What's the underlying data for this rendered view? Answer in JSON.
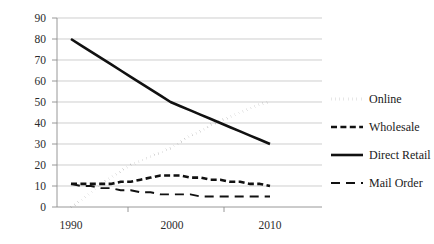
{
  "chart_data": {
    "type": "line",
    "title": "",
    "xlabel": "",
    "ylabel": "",
    "x": [
      1990,
      1991,
      1992,
      1993,
      1994,
      1995,
      1996,
      1997,
      1998,
      1999,
      2000,
      2001,
      2002,
      2003,
      2004,
      2005,
      2006,
      2007,
      2008,
      2009,
      2010
    ],
    "xlim": [
      1990,
      2010
    ],
    "ylim": [
      0,
      90
    ],
    "ytick_labels": [
      "0",
      "10",
      "20",
      "30",
      "40",
      "50",
      "60",
      "70",
      "80",
      "90"
    ],
    "ytick_values": [
      0,
      10,
      20,
      30,
      40,
      50,
      60,
      70,
      80,
      90
    ],
    "xtick_labels": [
      "1990",
      "2000",
      "2010"
    ],
    "xtick_values": [
      1990,
      2000,
      2010
    ],
    "grid": "horizontal",
    "legend_position": "right",
    "series": [
      {
        "name": "Online",
        "style": "dotted",
        "color": "#111111",
        "values": [
          0,
          3,
          7,
          11,
          14,
          17,
          20,
          22,
          24,
          26,
          28,
          31,
          34,
          36,
          39,
          41,
          43,
          45,
          47,
          49,
          50
        ]
      },
      {
        "name": "Wholesale",
        "style": "dashed",
        "color": "#111111",
        "values": [
          11,
          11,
          11,
          11,
          11,
          12,
          12,
          13,
          14,
          15,
          15,
          15,
          14,
          14,
          13,
          13,
          12,
          12,
          11,
          11,
          10
        ]
      },
      {
        "name": "Direct Retail",
        "style": "solid",
        "color": "#111111",
        "values": [
          80,
          77,
          74,
          71,
          68,
          65,
          62,
          59,
          56,
          53,
          50,
          48,
          46,
          44,
          42,
          40,
          38,
          36,
          34,
          32,
          30
        ]
      },
      {
        "name": "Mail Order",
        "style": "longdash",
        "color": "#111111",
        "values": [
          11,
          10,
          10,
          9,
          9,
          8,
          8,
          7,
          7,
          6,
          6,
          6,
          6,
          5,
          5,
          5,
          5,
          5,
          5,
          5,
          5
        ]
      }
    ]
  },
  "legend": {
    "items": [
      {
        "label": "Online",
        "style": "dotted"
      },
      {
        "label": "Wholesale",
        "style": "dashed"
      },
      {
        "label": "Direct Retail",
        "style": "solid"
      },
      {
        "label": "Mail Order",
        "style": "longdash"
      }
    ]
  },
  "axes": {
    "y_labels": [
      "90",
      "80",
      "70",
      "60",
      "50",
      "40",
      "30",
      "20",
      "10",
      "0"
    ],
    "x_labels": [
      "1990",
      "2000",
      "2010"
    ]
  }
}
